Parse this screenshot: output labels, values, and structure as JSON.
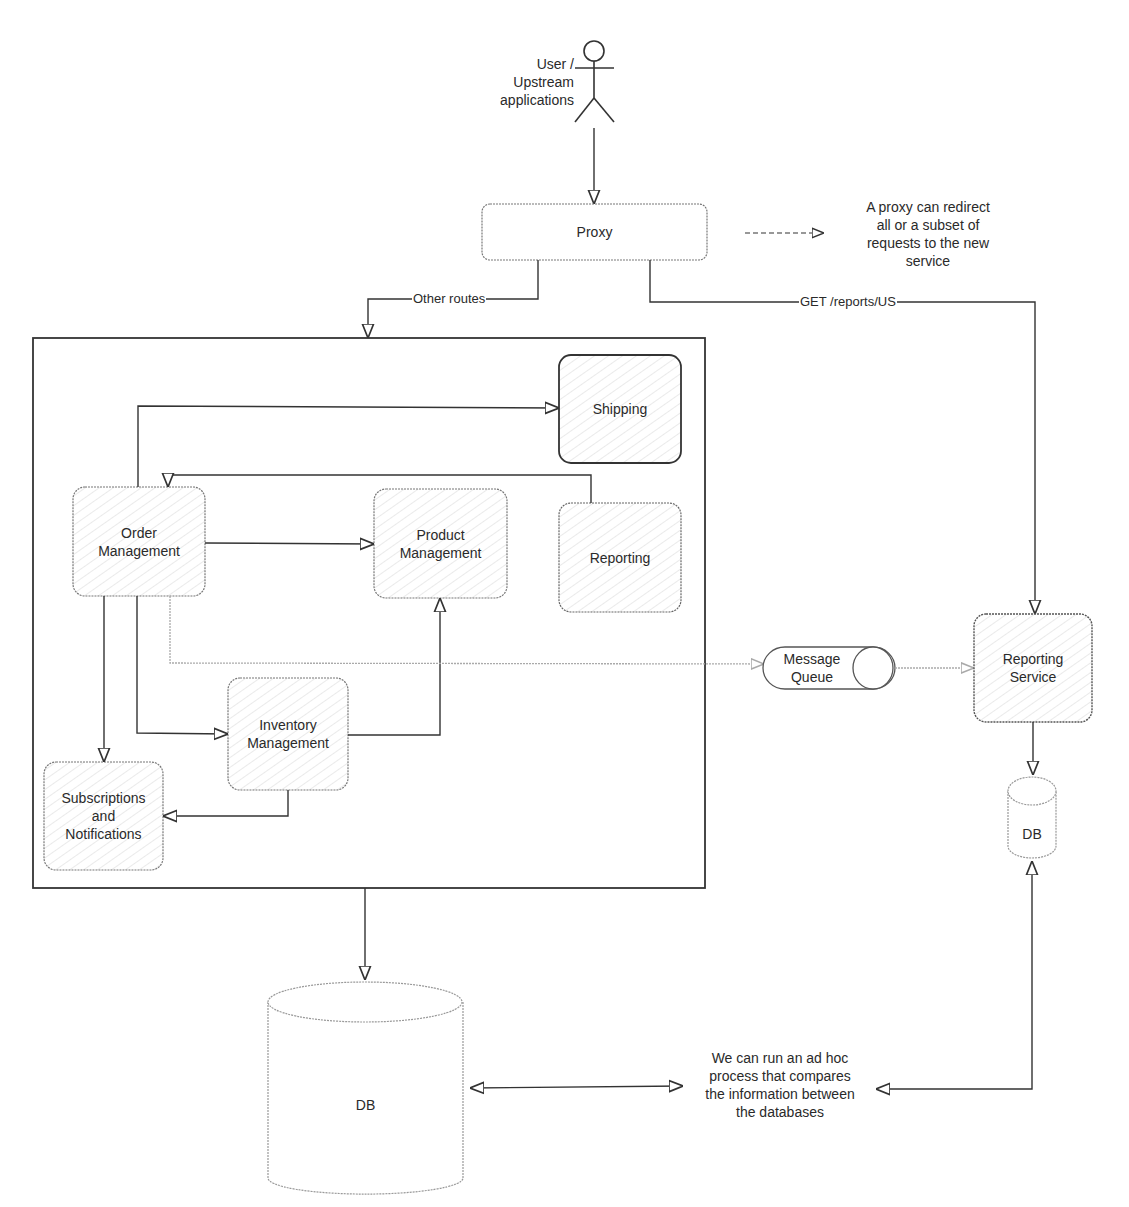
{
  "actor": {
    "label": "User /\nUpstream applications",
    "icon": "stick-figure-icon"
  },
  "proxy": {
    "label": "Proxy"
  },
  "proxy_note": {
    "text": "A proxy can redirect\nall or a subset of\nrequests to the new\nservice"
  },
  "edges": {
    "other_routes": "Other routes",
    "get_reports": "GET /reports/US"
  },
  "monolith": {
    "services": [
      {
        "id": "shipping",
        "label": "Shipping"
      },
      {
        "id": "order-management",
        "label": "Order\nManagement"
      },
      {
        "id": "product-management",
        "label": "Product\nManagement"
      },
      {
        "id": "reporting",
        "label": "Reporting"
      },
      {
        "id": "inventory-management",
        "label": "Inventory\nManagement"
      },
      {
        "id": "subscriptions-notifications",
        "label": "Subscriptions\nand\nNotifications"
      }
    ]
  },
  "message_queue": {
    "label": "Message\nQueue"
  },
  "reporting_service": {
    "label": "Reporting\nService"
  },
  "reporting_db": {
    "label": "DB"
  },
  "main_db": {
    "label": "DB"
  },
  "compare_note": {
    "text": "We can run an ad hoc\nprocess that compares\nthe information between\nthe databases"
  },
  "colors": {
    "stroke": "#333333",
    "dashed": "#999999",
    "hatch": "#d8d8d8"
  }
}
